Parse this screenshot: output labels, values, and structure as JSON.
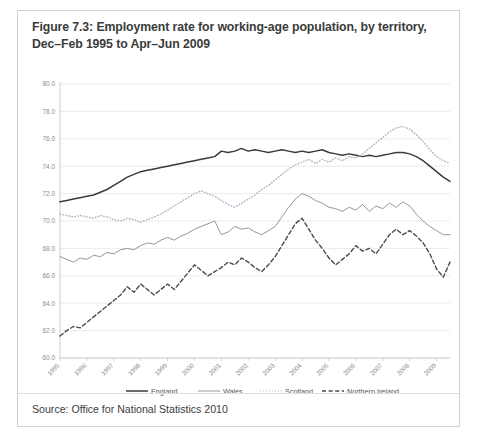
{
  "figure": {
    "title_line1": "Figure 7.3: Employment rate for working-age population, by territory,",
    "title_line2": "Dec–Feb 1995 to Apr–Jun 2009",
    "source": "Source: Office for National Statistics 2010"
  },
  "chart_data": {
    "type": "line",
    "title": "Figure 7.3: Employment rate for working-age population, by territory, Dec–Feb 1995 to Apr–Jun 2009",
    "xlabel": "",
    "ylabel": "",
    "ylim": [
      60.0,
      80.0
    ],
    "ytick_step": 2.0,
    "yticks": [
      "80.0",
      "78.0",
      "76.0",
      "74.0",
      "72.0",
      "70.0",
      "68.0",
      "66.0",
      "64.0",
      "62.0",
      "60.0"
    ],
    "xticks": [
      "1995",
      "1996",
      "1997",
      "1998",
      "1999",
      "2000",
      "2001",
      "2002",
      "2003",
      "2004",
      "2005",
      "2006",
      "2007",
      "2008",
      "2009"
    ],
    "xlim": [
      1995.0,
      2009.5
    ],
    "grid": "horizontal",
    "legend_position": "bottom",
    "colors": {
      "england": "#3a3a3a",
      "wales": "#8a8a8a",
      "scotland": "#b4b4c8",
      "northern_ireland": "#4a4a4a"
    },
    "series": [
      {
        "name": "England",
        "style": "solid-bold",
        "x": [
          1995.0,
          1995.25,
          1995.5,
          1995.75,
          1996.0,
          1996.25,
          1996.5,
          1996.75,
          1997.0,
          1997.25,
          1997.5,
          1997.75,
          1998.0,
          1998.25,
          1998.5,
          1998.75,
          1999.0,
          1999.25,
          1999.5,
          1999.75,
          2000.0,
          2000.25,
          2000.5,
          2000.75,
          2001.0,
          2001.25,
          2001.5,
          2001.75,
          2002.0,
          2002.25,
          2002.5,
          2002.75,
          2003.0,
          2003.25,
          2003.5,
          2003.75,
          2004.0,
          2004.25,
          2004.5,
          2004.75,
          2005.0,
          2005.25,
          2005.5,
          2005.75,
          2006.0,
          2006.25,
          2006.5,
          2006.75,
          2007.0,
          2007.25,
          2007.5,
          2007.75,
          2008.0,
          2008.25,
          2008.5,
          2008.75,
          2009.0,
          2009.25,
          2009.5
        ],
        "values": [
          71.4,
          71.5,
          71.6,
          71.7,
          71.8,
          71.9,
          72.1,
          72.3,
          72.6,
          72.9,
          73.2,
          73.4,
          73.6,
          73.7,
          73.8,
          73.9,
          74.0,
          74.1,
          74.2,
          74.3,
          74.4,
          74.5,
          74.6,
          74.7,
          75.1,
          75.0,
          75.1,
          75.3,
          75.1,
          75.2,
          75.1,
          75.0,
          75.1,
          75.2,
          75.1,
          75.0,
          75.1,
          75.0,
          75.1,
          75.2,
          75.0,
          74.9,
          74.8,
          74.9,
          74.8,
          74.7,
          74.8,
          74.7,
          74.8,
          74.9,
          75.0,
          75.0,
          74.9,
          74.7,
          74.4,
          74.0,
          73.6,
          73.2,
          72.9
        ]
      },
      {
        "name": "Wales",
        "style": "solid-thin",
        "x": [
          1995.0,
          1995.25,
          1995.5,
          1995.75,
          1996.0,
          1996.25,
          1996.5,
          1996.75,
          1997.0,
          1997.25,
          1997.5,
          1997.75,
          1998.0,
          1998.25,
          1998.5,
          1998.75,
          1999.0,
          1999.25,
          1999.5,
          1999.75,
          2000.0,
          2000.25,
          2000.5,
          2000.75,
          2001.0,
          2001.25,
          2001.5,
          2001.75,
          2002.0,
          2002.25,
          2002.5,
          2002.75,
          2003.0,
          2003.25,
          2003.5,
          2003.75,
          2004.0,
          2004.25,
          2004.5,
          2004.75,
          2005.0,
          2005.25,
          2005.5,
          2005.75,
          2006.0,
          2006.25,
          2006.5,
          2006.75,
          2007.0,
          2007.25,
          2007.5,
          2007.75,
          2008.0,
          2008.25,
          2008.5,
          2008.75,
          2009.0,
          2009.25,
          2009.5
        ],
        "values": [
          67.4,
          67.2,
          67.0,
          67.3,
          67.2,
          67.5,
          67.4,
          67.7,
          67.6,
          67.9,
          68.0,
          67.9,
          68.2,
          68.4,
          68.3,
          68.6,
          68.8,
          68.6,
          68.9,
          69.1,
          69.4,
          69.6,
          69.8,
          70.0,
          69.0,
          69.2,
          69.6,
          69.4,
          69.5,
          69.2,
          69.0,
          69.3,
          69.6,
          70.3,
          71.0,
          71.6,
          72.0,
          71.8,
          71.5,
          71.3,
          71.0,
          70.9,
          70.7,
          71.0,
          70.8,
          71.2,
          70.7,
          71.1,
          70.9,
          71.3,
          71.0,
          71.4,
          71.1,
          70.5,
          70.0,
          69.6,
          69.3,
          69.0,
          69.0
        ]
      },
      {
        "name": "Scotland",
        "style": "dotted",
        "x": [
          1995.0,
          1995.25,
          1995.5,
          1995.75,
          1996.0,
          1996.25,
          1996.5,
          1996.75,
          1997.0,
          1997.25,
          1997.5,
          1997.75,
          1998.0,
          1998.25,
          1998.5,
          1998.75,
          1999.0,
          1999.25,
          1999.5,
          1999.75,
          2000.0,
          2000.25,
          2000.5,
          2000.75,
          2001.0,
          2001.25,
          2001.5,
          2001.75,
          2002.0,
          2002.25,
          2002.5,
          2002.75,
          2003.0,
          2003.25,
          2003.5,
          2003.75,
          2004.0,
          2004.25,
          2004.5,
          2004.75,
          2005.0,
          2005.25,
          2005.5,
          2005.75,
          2006.0,
          2006.25,
          2006.5,
          2006.75,
          2007.0,
          2007.25,
          2007.5,
          2007.75,
          2008.0,
          2008.25,
          2008.5,
          2008.75,
          2009.0,
          2009.25,
          2009.5
        ],
        "values": [
          70.5,
          70.4,
          70.3,
          70.4,
          70.3,
          70.2,
          70.4,
          70.3,
          70.1,
          70.0,
          70.2,
          70.1,
          69.9,
          70.1,
          70.3,
          70.5,
          70.8,
          71.1,
          71.4,
          71.7,
          72.0,
          72.2,
          72.0,
          71.8,
          71.5,
          71.2,
          71.0,
          71.3,
          71.6,
          71.9,
          72.3,
          72.6,
          73.0,
          73.4,
          73.8,
          74.1,
          74.3,
          74.5,
          74.2,
          74.5,
          74.3,
          74.6,
          74.4,
          74.7,
          74.6,
          74.9,
          75.3,
          75.7,
          76.1,
          76.5,
          76.8,
          76.9,
          76.7,
          76.3,
          75.8,
          75.2,
          74.7,
          74.4,
          74.2
        ]
      },
      {
        "name": "Northern Ireland",
        "style": "dashed",
        "x": [
          1995.0,
          1995.25,
          1995.5,
          1995.75,
          1996.0,
          1996.25,
          1996.5,
          1996.75,
          1997.0,
          1997.25,
          1997.5,
          1997.75,
          1998.0,
          1998.25,
          1998.5,
          1998.75,
          1999.0,
          1999.25,
          1999.5,
          1999.75,
          2000.0,
          2000.25,
          2000.5,
          2000.75,
          2001.0,
          2001.25,
          2001.5,
          2001.75,
          2002.0,
          2002.25,
          2002.5,
          2002.75,
          2003.0,
          2003.25,
          2003.5,
          2003.75,
          2004.0,
          2004.25,
          2004.5,
          2004.75,
          2005.0,
          2005.25,
          2005.5,
          2005.75,
          2006.0,
          2006.25,
          2006.5,
          2006.75,
          2007.0,
          2007.25,
          2007.5,
          2007.75,
          2008.0,
          2008.25,
          2008.5,
          2008.75,
          2009.0,
          2009.25,
          2009.5
        ],
        "values": [
          61.6,
          62.0,
          62.3,
          62.2,
          62.6,
          63.0,
          63.4,
          63.8,
          64.2,
          64.6,
          65.2,
          64.8,
          65.4,
          65.0,
          64.6,
          65.0,
          65.4,
          65.0,
          65.6,
          66.2,
          66.8,
          66.4,
          66.0,
          66.3,
          66.6,
          67.0,
          66.8,
          67.3,
          67.0,
          66.6,
          66.3,
          66.8,
          67.4,
          68.2,
          69.0,
          69.8,
          70.2,
          69.4,
          68.6,
          68.0,
          67.3,
          66.8,
          67.2,
          67.6,
          68.2,
          67.8,
          68.0,
          67.6,
          68.3,
          69.0,
          69.4,
          69.0,
          69.3,
          68.9,
          68.4,
          67.6,
          66.5,
          65.9,
          67.0
        ]
      }
    ]
  },
  "legend": [
    {
      "label": "England"
    },
    {
      "label": "Wales"
    },
    {
      "label": "Scotland"
    },
    {
      "label": "Northern Ireland"
    }
  ]
}
